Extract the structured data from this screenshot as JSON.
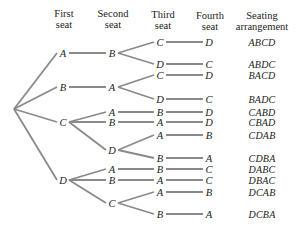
{
  "headers": [
    {
      "line1": "First",
      "line2": "seat"
    },
    {
      "line1": "Second",
      "line2": "seat"
    },
    {
      "line1": "Third",
      "line2": "seat"
    },
    {
      "line1": "Fourth",
      "line2": "seat"
    },
    {
      "line1": "Seating",
      "line2": "arrangement"
    }
  ],
  "line_color": "#8a8a8a",
  "tree": {
    "level1": [
      {
        "label": "A",
        "y": 53
      },
      {
        "label": "B",
        "y": 87
      },
      {
        "label": "C",
        "y": 122
      },
      {
        "label": "D",
        "y": 180
      }
    ],
    "level2": [
      {
        "label": "B",
        "y": 53,
        "parent": 0
      },
      {
        "label": "A",
        "y": 87,
        "parent": 1
      },
      {
        "label": "A",
        "y": 112,
        "parent": 2
      },
      {
        "label": "B",
        "y": 122,
        "parent": 2
      },
      {
        "label": "D",
        "y": 150,
        "parent": 2
      },
      {
        "label": "A",
        "y": 169,
        "parent": 3
      },
      {
        "label": "B",
        "y": 180,
        "parent": 3
      },
      {
        "label": "C",
        "y": 203,
        "parent": 3
      }
    ],
    "level3": [
      {
        "label": "C",
        "y": 42,
        "parent": 0
      },
      {
        "label": "D",
        "y": 64,
        "parent": 0
      },
      {
        "label": "C",
        "y": 75,
        "parent": 1
      },
      {
        "label": "D",
        "y": 99,
        "parent": 1
      },
      {
        "label": "B",
        "y": 112,
        "parent": 2
      },
      {
        "label": "A",
        "y": 122,
        "parent": 3
      },
      {
        "label": "A",
        "y": 135,
        "parent": 4
      },
      {
        "label": "B",
        "y": 158,
        "parent": 4
      },
      {
        "label": "B",
        "y": 169,
        "parent": 5
      },
      {
        "label": "A",
        "y": 180,
        "parent": 6
      },
      {
        "label": "A",
        "y": 192,
        "parent": 7
      },
      {
        "label": "B",
        "y": 214,
        "parent": 7
      }
    ],
    "level4": [
      {
        "label": "D",
        "y": 42
      },
      {
        "label": "C",
        "y": 64
      },
      {
        "label": "D",
        "y": 75
      },
      {
        "label": "C",
        "y": 99
      },
      {
        "label": "D",
        "y": 112
      },
      {
        "label": "D",
        "y": 122
      },
      {
        "label": "B",
        "y": 135
      },
      {
        "label": "A",
        "y": 158
      },
      {
        "label": "C",
        "y": 169
      },
      {
        "label": "C",
        "y": 180
      },
      {
        "label": "B",
        "y": 192
      },
      {
        "label": "A",
        "y": 214
      }
    ],
    "arrangements": [
      {
        "label": "ABCD",
        "y": 42
      },
      {
        "label": "ABDC",
        "y": 64
      },
      {
        "label": "BACD",
        "y": 75
      },
      {
        "label": "BADC",
        "y": 99
      },
      {
        "label": "CABD",
        "y": 112
      },
      {
        "label": "CBAD",
        "y": 122
      },
      {
        "label": "CDAB",
        "y": 135
      },
      {
        "label": "CDBA",
        "y": 158
      },
      {
        "label": "DABC",
        "y": 169
      },
      {
        "label": "DBAC",
        "y": 180
      },
      {
        "label": "DCAB",
        "y": 192
      },
      {
        "label": "DCBA",
        "y": 214
      }
    ]
  }
}
